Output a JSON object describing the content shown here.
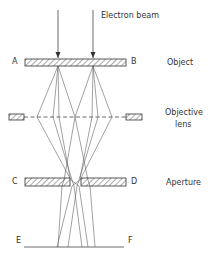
{
  "diagram": {
    "beam_label": "Electron beam",
    "point_labels": {
      "a": "A",
      "b": "B",
      "c": "C",
      "d": "D",
      "e": "E",
      "f": "F"
    },
    "components": [
      {
        "name": "object",
        "label": "Object"
      },
      {
        "name": "objective-lens",
        "label_line1": "Objective",
        "label_line2": "lens"
      },
      {
        "name": "aperture",
        "label": "Aperture"
      }
    ],
    "colors": {
      "line": "#444444",
      "text": "#333333",
      "background": "#ffffff"
    }
  }
}
